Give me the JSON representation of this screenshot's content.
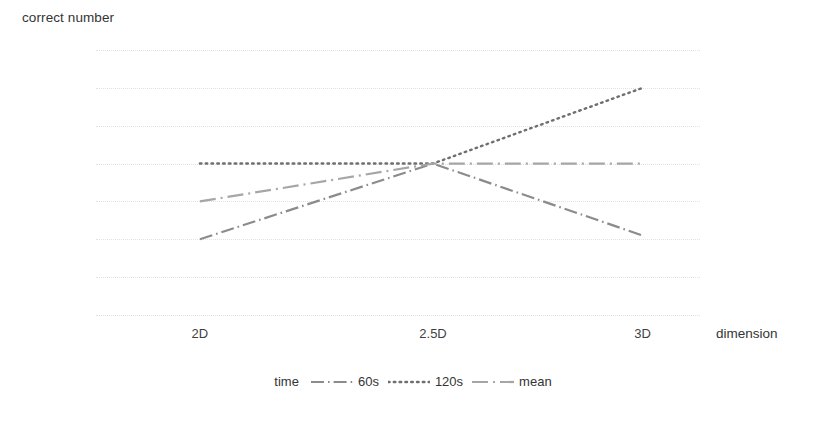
{
  "chart_data": {
    "type": "line",
    "title": "",
    "xlabel": "dimension",
    "ylabel": "correct number",
    "categories": [
      "2D",
      "2.5D",
      "3D"
    ],
    "x_ticks": [
      "2D",
      "2.5D",
      "3D"
    ],
    "y_ticks": [
      "15",
      "15.5",
      "16",
      "16.5",
      "17",
      "17.5",
      "18",
      "18.5"
    ],
    "y_tick_values": [
      15,
      15.5,
      16,
      16.5,
      17,
      17.5,
      18,
      18.5
    ],
    "ylim": [
      15,
      18.5
    ],
    "grid": true,
    "legend_position": "bottom",
    "legend_title": "time",
    "series": [
      {
        "name": "60s",
        "values": [
          16.0,
          17.0,
          16.05
        ],
        "style": "dash-dot",
        "color": "#8b8b8b"
      },
      {
        "name": "120s",
        "values": [
          17.0,
          17.0,
          18.0
        ],
        "style": "dotted",
        "color": "#6f6f6f"
      },
      {
        "name": "mean",
        "values": [
          16.5,
          17.0,
          17.0
        ],
        "style": "dash-dot-long",
        "color": "#a6a6a6"
      }
    ]
  },
  "axis": {
    "y_title": "correct number",
    "x_title": "dimension"
  },
  "legend": {
    "title": "time",
    "entries": [
      {
        "label": "60s"
      },
      {
        "label": "120s"
      },
      {
        "label": "mean"
      }
    ]
  },
  "colors": {
    "gridline": "#e2e2e2",
    "text": "#3f3f3f",
    "series_60s": "#8b8b8b",
    "series_120s": "#6f6f6f",
    "series_mean": "#a6a6a6"
  }
}
